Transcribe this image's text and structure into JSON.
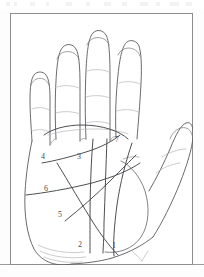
{
  "figure": {
    "frame": {
      "border_color": "#8d8d90",
      "background": "#ffffff"
    },
    "ink_color": "#5a5a5e",
    "faint_ink_color": "#b6b6ba",
    "labels": [
      {
        "id": "1",
        "text": "1",
        "x": 112,
        "y": 242
      },
      {
        "id": "2",
        "text": "2",
        "x": 78,
        "y": 241
      },
      {
        "id": "3",
        "text": "3",
        "x": 77,
        "y": 153
      },
      {
        "id": "4",
        "text": "4",
        "x": 41,
        "y": 153
      },
      {
        "id": "5",
        "text": "5",
        "x": 58,
        "y": 211
      },
      {
        "id": "6",
        "text": "6",
        "x": 44,
        "y": 185
      },
      {
        "id": "7",
        "text": "7",
        "x": 115,
        "y": 136
      }
    ],
    "line_legend": [
      {
        "number": "1",
        "name": "line-1"
      },
      {
        "number": "2",
        "name": "line-2"
      },
      {
        "number": "3",
        "name": "line-3"
      },
      {
        "number": "4",
        "name": "line-4"
      },
      {
        "number": "5",
        "name": "line-5"
      },
      {
        "number": "6",
        "name": "line-6"
      },
      {
        "number": "7",
        "name": "line-7"
      }
    ]
  },
  "scan": {
    "top_artifacts": [
      {
        "x": 6,
        "w": 4
      },
      {
        "x": 14,
        "w": 3
      },
      {
        "x": 30,
        "w": 5
      },
      {
        "x": 46,
        "w": 3
      },
      {
        "x": 66,
        "w": 6
      },
      {
        "x": 86,
        "w": 4
      },
      {
        "x": 104,
        "w": 7
      },
      {
        "x": 122,
        "w": 5
      },
      {
        "x": 140,
        "w": 8
      },
      {
        "x": 156,
        "w": 4
      },
      {
        "x": 170,
        "w": 9
      },
      {
        "x": 186,
        "w": 6
      }
    ]
  }
}
